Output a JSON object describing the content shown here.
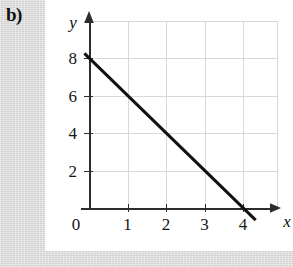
{
  "label": {
    "text": "b)"
  },
  "chart_data": {
    "type": "line",
    "title": "",
    "xlabel": "x",
    "ylabel": "y",
    "xlim": [
      0,
      4.9
    ],
    "ylim": [
      0,
      9.7
    ],
    "grid": true,
    "legend": false,
    "x_ticks": [
      "0",
      "1",
      "2",
      "3",
      "4"
    ],
    "x_tick_values": [
      0,
      1,
      2,
      3,
      4
    ],
    "y_ticks": [
      "2",
      "4",
      "6",
      "8"
    ],
    "y_tick_values": [
      2,
      4,
      6,
      8
    ],
    "series": [
      {
        "name": "line",
        "equation": "y = -2x + 8",
        "slope": -2,
        "intercept": 8,
        "x": [
          0,
          4
        ],
        "values": [
          8,
          0
        ],
        "x_drawn": [
          -0.12,
          4.33
        ],
        "y_drawn": [
          8.25,
          -0.65
        ],
        "color": "#111111",
        "width": 3
      }
    ],
    "axis_color": "#2c2c2c",
    "grid_color": "#d7d7d7",
    "background": "#ffffff"
  },
  "icons": {
    "x_axis_arrow": "arrow-right-icon",
    "y_axis_arrow": "arrow-up-icon"
  }
}
